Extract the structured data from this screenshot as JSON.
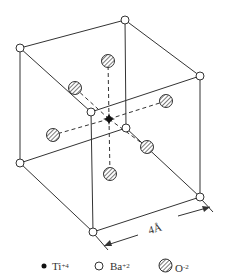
{
  "figure": {
    "dimension_label": "4Å"
  },
  "atoms": {
    "corners": [
      "Ba",
      "Ba",
      "Ba",
      "Ba",
      "Ba",
      "Ba",
      "Ba",
      "Ba"
    ],
    "center": "Ti",
    "face_centers": [
      "O",
      "O",
      "O",
      "O",
      "O",
      "O"
    ]
  },
  "legend": [
    {
      "symbol": "filled-dot",
      "element": "Ti",
      "charge": "+4"
    },
    {
      "symbol": "open-circle",
      "element": "Ba",
      "charge": "+2"
    },
    {
      "symbol": "hatched-circle",
      "element": "O",
      "charge": "-2"
    }
  ],
  "colors": {
    "line": "#333333",
    "ti_fill": "#111111",
    "background": "#ffffff"
  }
}
